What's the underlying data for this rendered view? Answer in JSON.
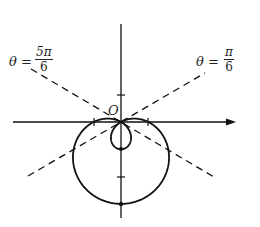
{
  "diagram": {
    "type": "polar-curve",
    "curve": "limacon r = 1 - 2 sin(theta)",
    "origin_label": "O",
    "lines": [
      {
        "name": "theta-5pi-6",
        "theta_label": "θ =",
        "numerator": "5π",
        "denominator": "6"
      },
      {
        "name": "theta-pi-6",
        "theta_label": "θ =",
        "numerator": "π",
        "denominator": "6"
      }
    ],
    "colors": {
      "stroke": "#111111",
      "background": "#ffffff"
    }
  }
}
